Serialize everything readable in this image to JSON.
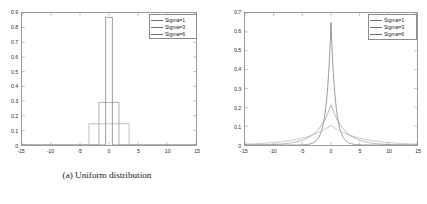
{
  "figure": {
    "panels": [
      {
        "id": "a",
        "caption": "(a) Uniform distribution",
        "legend": {
          "entries": [
            "Sigma=1",
            "Sigma=3",
            "Sigma=6"
          ]
        }
      },
      {
        "id": "b",
        "caption": "(b) Laplacian distribution",
        "legend": {
          "entries": [
            "Sigma=1",
            "Sigma=3",
            "Sigma=6"
          ]
        }
      }
    ]
  },
  "chart_data": [
    {
      "type": "bar",
      "title": "(a) Uniform distribution",
      "xlabel": "",
      "ylabel": "",
      "xlim": [
        -15,
        15
      ],
      "ylim": [
        0,
        0.9
      ],
      "xticks": [
        -15,
        -10,
        -5,
        0,
        5,
        10,
        15
      ],
      "xticklabels": [
        "-15",
        "-10",
        "-5",
        "0",
        "5",
        "10",
        "15"
      ],
      "yticks": [
        0,
        0.1,
        0.2,
        0.3,
        0.4,
        0.5,
        0.6,
        0.7,
        0.8,
        0.9
      ],
      "yticklabels": [
        "0",
        "0.1",
        "0.2",
        "0.3",
        "0.4",
        "0.5",
        "0.6",
        "0.7",
        "0.8",
        "0.9"
      ],
      "grid": false,
      "legend_position": "upper right",
      "series": [
        {
          "name": "Sigma=1",
          "color": "#6d6d6d",
          "shape": "rectangular-pulse",
          "half_width": 0.58,
          "height": 0.87
        },
        {
          "name": "Sigma=3",
          "color": "#8f8f8f",
          "shape": "rectangular-pulse",
          "half_width": 1.73,
          "height": 0.29
        },
        {
          "name": "Sigma=6",
          "color": "#a8a8a8",
          "shape": "rectangular-pulse",
          "half_width": 3.46,
          "height": 0.145
        }
      ]
    },
    {
      "type": "line",
      "title": "(b) Laplacian distribution",
      "xlabel": "",
      "ylabel": "",
      "xlim": [
        -15,
        15
      ],
      "ylim": [
        0,
        0.7
      ],
      "xticks": [
        -15,
        -10,
        -5,
        0,
        5,
        10,
        15
      ],
      "xticklabels": [
        "-15",
        "-10",
        "-5",
        "0",
        "5",
        "10",
        "15"
      ],
      "yticks": [
        0,
        0.1,
        0.2,
        0.3,
        0.4,
        0.5,
        0.6,
        0.7
      ],
      "yticklabels": [
        "0",
        "0.1",
        "0.2",
        "0.3",
        "0.4",
        "0.5",
        "0.6",
        "0.7"
      ],
      "grid": false,
      "legend_position": "upper right",
      "series": [
        {
          "name": "Sigma=1",
          "color": "#6d6d6d",
          "shape": "laplace-pdf",
          "scale": 0.77,
          "peak": 0.65
        },
        {
          "name": "Sigma=3",
          "color": "#8f8f8f",
          "shape": "laplace-pdf",
          "scale": 2.35,
          "peak": 0.213
        },
        {
          "name": "Sigma=6",
          "color": "#a8a8a8",
          "shape": "laplace-pdf",
          "scale": 4.8,
          "peak": 0.104
        }
      ]
    }
  ]
}
